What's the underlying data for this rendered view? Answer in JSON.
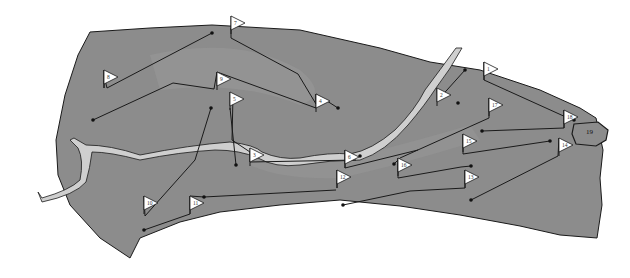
{
  "map": {
    "title": "Golf course layout",
    "colors": {
      "background": "#ffffff",
      "terrain": "#8c8c8c",
      "terrain_light": "#9a9a9a",
      "river": "#c8c8c8",
      "outline": "#1a1a1a",
      "flag": "#ffffff"
    },
    "holes": [
      {
        "number": "1",
        "flag": [
          484,
          62
        ],
        "path": [
          [
            484,
            62
          ],
          [
            484,
            80
          ],
          [
            568,
            118
          ],
          [
            574,
            120
          ]
        ]
      },
      {
        "number": "2",
        "flag": [
          437,
          88
        ],
        "path": [
          [
            465,
            70
          ],
          [
            438,
            100
          ],
          [
            437,
            88
          ]
        ]
      },
      {
        "number": "3",
        "flag": [
          250,
          148
        ],
        "path": [
          [
            233,
            95
          ],
          [
            232,
            140
          ],
          [
            250,
            152
          ],
          [
            250,
            162
          ],
          [
            356,
            160
          ]
        ]
      },
      {
        "number": "4",
        "flag": [
          316,
          94
        ],
        "path": [
          [
            231,
            28
          ],
          [
            231,
            38
          ],
          [
            298,
            74
          ],
          [
            316,
            104
          ],
          [
            316,
            94
          ],
          [
            338,
            108
          ]
        ]
      },
      {
        "number": "5",
        "flag": [
          230,
          92
        ],
        "path": [
          [
            230,
            108
          ],
          [
            236,
            165
          ]
        ]
      },
      {
        "number": "6",
        "flag": [
          345,
          150
        ],
        "path": [
          [
            345,
            150
          ],
          [
            345,
            168
          ],
          [
            418,
            150
          ]
        ]
      },
      {
        "number": "7",
        "flag": [
          231,
          16
        ],
        "path": [
          [
            212,
            33
          ],
          [
            107,
            88
          ],
          [
            105,
            80
          ]
        ]
      },
      {
        "number": "8",
        "flag": [
          104,
          70
        ],
        "path": [
          [
            104,
            70
          ],
          [
            104,
            88
          ]
        ]
      },
      {
        "number": "9",
        "flag": [
          217,
          72
        ],
        "path": [
          [
            93,
            120
          ],
          [
            173,
            83
          ],
          [
            214,
            89
          ],
          [
            217,
            72
          ],
          [
            316,
            108
          ]
        ]
      },
      {
        "number": "10",
        "flag": [
          144,
          196
        ],
        "path": [
          [
            211,
            108
          ],
          [
            195,
            160
          ],
          [
            145,
            216
          ],
          [
            144,
            196
          ]
        ]
      },
      {
        "number": "11",
        "flag": [
          190,
          196
        ],
        "path": [
          [
            144,
            230
          ],
          [
            190,
            214
          ],
          [
            190,
            196
          ],
          [
            204,
            197
          ],
          [
            336,
            190
          ]
        ]
      },
      {
        "number": "12",
        "flag": [
          337,
          170
        ],
        "path": [
          [
            337,
            188
          ],
          [
            337,
            170
          ]
        ]
      },
      {
        "number": "13",
        "flag": [
          465,
          170
        ],
        "path": [
          [
            343,
            205
          ],
          [
            410,
            191
          ],
          [
            465,
            188
          ],
          [
            465,
            170
          ]
        ]
      },
      {
        "number": "14",
        "flag": [
          559,
          138
        ],
        "path": [
          [
            471,
            200
          ],
          [
            558,
            156
          ],
          [
            559,
            138
          ]
        ]
      },
      {
        "number": "15",
        "flag": [
          463,
          134
        ],
        "path": [
          [
            463,
            134
          ],
          [
            463,
            154
          ],
          [
            550,
            141
          ]
        ]
      },
      {
        "number": "16",
        "flag": [
          398,
          158
        ],
        "path": [
          [
            398,
            158
          ],
          [
            398,
            178
          ],
          [
            461,
            167
          ],
          [
            471,
            166
          ]
        ]
      },
      {
        "number": "17",
        "flag": [
          489,
          98
        ],
        "path": [
          [
            489,
            98
          ],
          [
            489,
            118
          ],
          [
            400,
            158
          ],
          [
            394,
            164
          ]
        ]
      },
      {
        "number": "18",
        "flag": [
          564,
          110
        ],
        "path": [
          [
            564,
            110
          ],
          [
            564,
            128
          ],
          [
            482,
            131
          ]
        ]
      }
    ],
    "green_19": {
      "label": "19",
      "position": [
        589,
        131
      ]
    },
    "tees": [
      [
        212,
        33
      ],
      [
        465,
        70
      ],
      [
        458,
        103
      ],
      [
        338,
        108
      ],
      [
        93,
        120
      ],
      [
        211,
        108
      ],
      [
        236,
        165
      ],
      [
        144,
        230
      ],
      [
        343,
        205
      ],
      [
        471,
        200
      ],
      [
        482,
        131
      ],
      [
        550,
        141
      ],
      [
        574,
        120
      ],
      [
        471,
        166
      ],
      [
        360,
        156
      ],
      [
        394,
        164
      ],
      [
        204,
        197
      ]
    ]
  }
}
